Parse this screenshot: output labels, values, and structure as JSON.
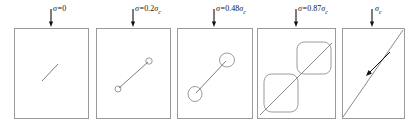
{
  "figure": {
    "stroke_color": "#9a9a9a",
    "crack_color": "#7d7d7d",
    "arrow_color": "#111111",
    "background": "#ffffff",
    "stress_symbol": "σ",
    "critical_symbol": "σ",
    "critical_subscript": "c"
  },
  "stages": [
    {
      "id": "stage-1",
      "label": "σ=0",
      "label_prefix": "σ=",
      "label_value": "0",
      "label_has_sigma_c": false,
      "stress_ratio": 0,
      "damage_state": "single short inclined microcrack",
      "box": {
        "x": 14,
        "y": 28,
        "w": 74,
        "h": 90
      },
      "crack": {
        "x1": 42,
        "y1": 81,
        "x2": 58,
        "y2": 64
      },
      "voids": [],
      "arrow": {
        "x": 51,
        "y_top": 9,
        "y_bottom": 27
      },
      "label_pos": {
        "x": 53,
        "y": 5
      }
    },
    {
      "id": "stage-2",
      "label": "σ=0.2σc",
      "label_prefix": "σ=",
      "label_value": "0.2",
      "label_has_sigma_c": true,
      "stress_ratio": 0.2,
      "damage_state": "extended crack with small voids at both tips",
      "box": {
        "x": 96,
        "y": 28,
        "w": 74,
        "h": 90
      },
      "crack": {
        "x1": 119,
        "y1": 88,
        "x2": 148,
        "y2": 62
      },
      "voids": [
        {
          "cx": 118,
          "cy": 89,
          "rx": 3,
          "ry": 3
        },
        {
          "cx": 149,
          "cy": 61,
          "rx": 3.2,
          "ry": 3.2
        }
      ],
      "arrow": {
        "x": 133,
        "y_top": 9,
        "y_bottom": 27
      },
      "label_pos": {
        "x": 135,
        "y": 5
      }
    },
    {
      "id": "stage-3",
      "label": "σ=0.48σc",
      "label_prefix": "σ=",
      "label_value": "0.48",
      "label_has_sigma_c": true,
      "stress_ratio": 0.48,
      "damage_state": "crack with enlarged rounded voids at both tips",
      "box": {
        "x": 177,
        "y": 28,
        "w": 75,
        "h": 90
      },
      "crack": {
        "x1": 196,
        "y1": 93,
        "x2": 226,
        "y2": 61
      },
      "voids": [
        {
          "cx": 195,
          "cy": 94,
          "rx": 7,
          "ry": 7.5
        },
        {
          "cx": 227,
          "cy": 60,
          "rx": 7.5,
          "ry": 7
        }
      ],
      "arrow": {
        "x": 214,
        "y_top": 9,
        "y_bottom": 27
      },
      "label_pos": {
        "x": 216,
        "y": 5
      }
    },
    {
      "id": "stage-4",
      "label": "σ=0.87σc",
      "label_prefix": "σ=",
      "label_value": "0.87",
      "label_has_sigma_c": true,
      "stress_ratio": 0.87,
      "damage_state": "through-going shear band with large rounded damage zones",
      "box": {
        "x": 257,
        "y": 28,
        "w": 78,
        "h": 90
      },
      "crack": {
        "x1": 260,
        "y1": 115,
        "x2": 332,
        "y2": 43
      },
      "voids": [
        {
          "cx": 281,
          "cy": 93,
          "rx": 17,
          "ry": 19,
          "shape": "rounded-rect"
        },
        {
          "cx": 314,
          "cy": 58,
          "rx": 17,
          "ry": 16,
          "shape": "rounded-rect"
        }
      ],
      "arrow": {
        "x": 296,
        "y_top": 9,
        "y_bottom": 27
      },
      "label_pos": {
        "x": 298,
        "y": 5
      }
    },
    {
      "id": "stage-5",
      "label": "σc",
      "label_prefix": "",
      "label_value": "",
      "label_has_sigma_c": true,
      "stress_ratio": 1,
      "damage_state": "complete corner-to-corner failure plane with slip arrow",
      "box": {
        "x": 342,
        "y": 28,
        "w": 62,
        "h": 90
      },
      "crack": {
        "x1": 343,
        "y1": 117,
        "x2": 403,
        "y2": 30
      },
      "voids": [],
      "slip_arrow": {
        "x1": 390,
        "y1": 52,
        "x2": 366,
        "y2": 76
      },
      "arrow": {
        "x": 372,
        "y_top": 9,
        "y_bottom": 27
      },
      "label_pos": {
        "x": 375,
        "y": 5
      }
    }
  ]
}
